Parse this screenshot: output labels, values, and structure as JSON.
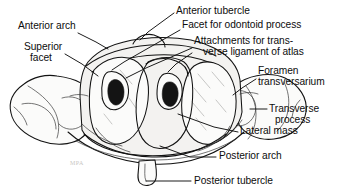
{
  "figure": {
    "width": 346,
    "height": 194,
    "background_color": "#ffffff",
    "ink_color": "#101010",
    "watermark_text": "MPA"
  },
  "labels": [
    {
      "id": "anterior-tubercle",
      "lines": [
        "Anterior tubercle"
      ],
      "x": 176,
      "y": 6,
      "align": "left"
    },
    {
      "id": "facet-for-odontoid-process",
      "lines": [
        "Facet for odontoid process"
      ],
      "x": 182,
      "y": 24,
      "align": "left"
    },
    {
      "id": "attachments-transverse-ligament",
      "lines": [
        "Attachments for trans-",
        "verse ligament of atlas"
      ],
      "x": 194,
      "y": 42,
      "align": "left"
    },
    {
      "id": "anterior-arch",
      "lines": [
        "Anterior arch"
      ],
      "x": 18,
      "y": 26,
      "align": "left"
    },
    {
      "id": "superior-facet",
      "lines": [
        "Superior",
        "facet"
      ],
      "x": 24,
      "y": 45,
      "align": "left"
    },
    {
      "id": "foramen-transversarium",
      "lines": [
        "Foramen",
        "transversarium"
      ],
      "x": 257,
      "y": 70,
      "align": "left"
    },
    {
      "id": "transverse-process",
      "lines": [
        "Transverse",
        "process"
      ],
      "x": 268,
      "y": 103,
      "align": "left"
    },
    {
      "id": "lateral-mass",
      "lines": [
        "Lateral mass"
      ],
      "x": 240,
      "y": 128,
      "align": "left"
    },
    {
      "id": "posterior-arch",
      "lines": [
        "Posterior arch"
      ],
      "x": 218,
      "y": 152,
      "align": "left"
    },
    {
      "id": "posterior-tubercle",
      "lines": [
        "Posterior tubercle"
      ],
      "x": 193,
      "y": 176,
      "align": "left"
    }
  ],
  "leader_lines": [
    {
      "id": "leader-anterior-tubercle",
      "d": "M 174 13 L 148 32 L 140 40"
    },
    {
      "id": "leader-facet-odontoid",
      "d": "M 180 30 L 120 66 L 112 71"
    },
    {
      "id": "leader-attachments-left",
      "d": "M 192 48 L 143 69 L 130 76"
    },
    {
      "id": "leader-attachments-right",
      "d": "M 192 52 L 165 72 L 156 78"
    },
    {
      "id": "leader-anterior-arch",
      "d": "M 78 32 L 104 45"
    },
    {
      "id": "leader-superior-facet",
      "d": "M 64 53 L 80 62 L 95 72"
    },
    {
      "id": "leader-foramen-transversarium",
      "d": "M 256 78 L 240 88 L 232 94"
    },
    {
      "id": "leader-transverse-process",
      "d": "M 266 109 L 252 109"
    },
    {
      "id": "leader-lateral-mass",
      "d": "M 238 131 L 215 126 L 175 114"
    },
    {
      "id": "leader-posterior-arch",
      "d": "M 216 156 L 192 156 L 162 145"
    },
    {
      "id": "leader-posterior-tubercle",
      "d": "M 191 180 L 140 180 L 128 176"
    }
  ],
  "anatomy_paths": {
    "left_transverse_process": "M 50 92 C 38 90 26 93 18 100 C 11 106 10 114 16 120 C 22 126 34 131 48 133 C 58 134 66 132 72 128",
    "right_transverse_process": "M 236 86 C 250 80 266 80 278 86 C 290 92 296 102 294 112 C 292 122 282 130 268 132 C 256 134 244 130 238 124",
    "posterior_arch": "M 70 130 C 96 148 128 156 160 156 C 194 156 224 146 248 128",
    "anterior_arch": "M 100 46 C 124 36 152 32 178 36 C 196 39 210 46 218 54"
  }
}
